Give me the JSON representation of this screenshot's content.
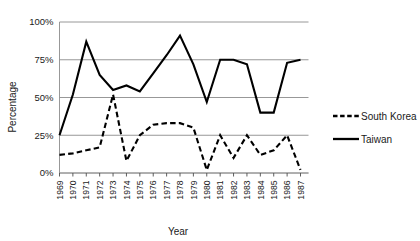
{
  "chart_data": {
    "type": "line",
    "title": "",
    "xlabel": "Year",
    "ylabel": "Percentage",
    "ylim": [
      0,
      100
    ],
    "yticks": [
      0,
      25,
      50,
      75,
      100
    ],
    "ytick_labels": [
      "0%",
      "25%",
      "50%",
      "75%",
      "100%"
    ],
    "grid": true,
    "legend_position": "right",
    "categories": [
      "1969",
      "1970",
      "1971",
      "1972",
      "1973",
      "1974",
      "1975",
      "1976",
      "1977",
      "1978",
      "1979",
      "1980",
      "1981",
      "1982",
      "1983",
      "1984",
      "1985",
      "1986",
      "1987"
    ],
    "series": [
      {
        "name": "South Korea",
        "style": "dashed",
        "color": "#000000",
        "values": [
          12,
          13,
          15,
          17,
          52,
          8,
          25,
          32,
          33,
          33,
          30,
          2,
          25,
          10,
          25,
          12,
          15,
          25,
          2
        ]
      },
      {
        "name": "Taiwan",
        "style": "solid",
        "color": "#000000",
        "values": [
          25,
          52,
          87,
          65,
          55,
          58,
          54,
          66,
          78,
          91,
          72,
          47,
          75,
          75,
          72,
          40,
          40,
          73,
          75
        ]
      }
    ]
  },
  "legend": {
    "entries": [
      {
        "label": "South Korea",
        "style": "dashed"
      },
      {
        "label": "Taiwan",
        "style": "solid"
      }
    ]
  },
  "axes": {
    "y_title": "Percentage",
    "x_title": "Year"
  }
}
